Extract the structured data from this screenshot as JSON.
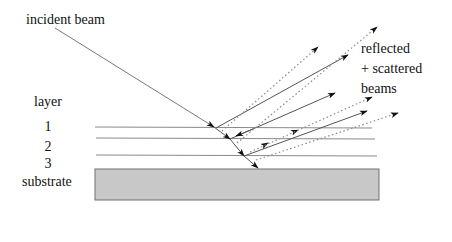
{
  "diagram": {
    "type": "multilayer reflection/scattering schematic",
    "labels": {
      "incident_beam": "incident beam",
      "reflected_line1": "reflected",
      "reflected_line2": "+ scattered",
      "reflected_line3": "beams",
      "layer_header": "layer",
      "layer_1": "1",
      "layer_2": "2",
      "layer_3": "3",
      "substrate": "substrate"
    },
    "layers": [
      {
        "name": "1",
        "interface_y": 127
      },
      {
        "name": "2",
        "interface_y": 138
      },
      {
        "name": "3",
        "interface_y": 156
      }
    ],
    "substrate": {
      "x": 95,
      "y": 169,
      "width": 284,
      "height": 31,
      "fill": "#c8c8c8",
      "stroke": "#707070"
    },
    "colors": {
      "line": "#555555",
      "dotted": "#8a8a8a",
      "arrowhead": "#111111",
      "text": "#111111"
    },
    "beams": {
      "incident": {
        "from": [
          55,
          28
        ],
        "to": [
          258,
          167
        ],
        "style": "solid"
      },
      "reflected_solid": [
        {
          "from": [
            216,
            127
          ],
          "to": [
            348,
            54
          ]
        },
        {
          "from": [
            232,
            139
          ],
          "to": [
            335,
            93
          ]
        },
        {
          "from": [
            245,
            156
          ],
          "to": [
            367,
            111
          ]
        }
      ],
      "scattered_dotted": [
        {
          "from": [
            224,
            131
          ],
          "to": [
            318,
            46
          ]
        },
        {
          "from": [
            239,
            144
          ],
          "to": [
            377,
            26
          ]
        },
        {
          "from": [
            250,
            152
          ],
          "to": [
            372,
            96
          ]
        },
        {
          "from": [
            256,
            160
          ],
          "to": [
            398,
            113
          ]
        }
      ]
    }
  }
}
